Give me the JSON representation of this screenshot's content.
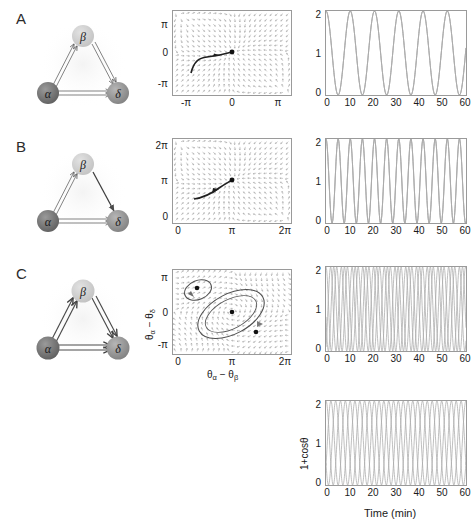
{
  "figure": {
    "panels": [
      {
        "letter": "A",
        "network": {
          "nodes": [
            {
              "id": "alpha",
              "label": "α",
              "shade": "dark"
            },
            {
              "id": "beta",
              "label": "β",
              "shade": "light"
            },
            {
              "id": "delta",
              "label": "δ",
              "shade": "medium"
            }
          ],
          "edges": [
            {
              "from": "alpha",
              "to": "beta",
              "style": "open-double"
            },
            {
              "from": "beta",
              "to": "delta",
              "style": "open-double"
            },
            {
              "from": "alpha",
              "to": "delta",
              "style": "open-double"
            }
          ]
        },
        "phase_plot": {
          "x_ticks": [
            "-π",
            "0",
            "π"
          ],
          "y_ticks": [
            "π",
            "0",
            "-π"
          ],
          "xlim": [
            -3.14159,
            3.14159
          ],
          "ylim": [
            -3.14159,
            3.14159
          ],
          "fixed_points": [
            {
              "x": 0,
              "y": 0
            }
          ],
          "trajectory_end": {
            "x": 0,
            "y": 0
          }
        },
        "time_plot": {
          "x_ticks": [
            "0",
            "10",
            "20",
            "30",
            "40",
            "50",
            "60"
          ],
          "y_ticks": [
            "0",
            "1",
            "2"
          ],
          "xlim": [
            0,
            60
          ],
          "ylim": [
            0,
            2
          ],
          "period_min": 10.4,
          "n_traces": 3,
          "phase_offsets_frac": [
            0.0,
            0.0,
            0.0
          ]
        }
      },
      {
        "letter": "B",
        "network": {
          "nodes": [
            {
              "id": "alpha",
              "label": "α",
              "shade": "dark"
            },
            {
              "id": "beta",
              "label": "β",
              "shade": "light"
            },
            {
              "id": "delta",
              "label": "δ",
              "shade": "medium"
            }
          ],
          "edges": [
            {
              "from": "alpha",
              "to": "beta",
              "style": "open-double"
            },
            {
              "from": "beta",
              "to": "delta",
              "style": "solid"
            },
            {
              "from": "alpha",
              "to": "delta",
              "style": "open-double"
            }
          ]
        },
        "phase_plot": {
          "x_ticks": [
            "0",
            "π",
            "2π"
          ],
          "y_ticks": [
            "2π",
            "π",
            "0"
          ],
          "xlim": [
            0,
            6.28318
          ],
          "ylim": [
            0,
            6.28318
          ],
          "fixed_points": [
            {
              "x": 3.14159,
              "y": 3.14159
            }
          ],
          "trajectory_end": {
            "x": 3.14159,
            "y": 3.14159
          }
        },
        "time_plot": {
          "x_ticks": [
            "0",
            "10",
            "20",
            "30",
            "40",
            "50",
            "60"
          ],
          "y_ticks": [
            "0",
            "1",
            "2"
          ],
          "xlim": [
            0,
            60
          ],
          "ylim": [
            0,
            2
          ],
          "period_min": 5.2,
          "n_traces": 3,
          "phase_offsets_frac": [
            0.0,
            0.0,
            0.0
          ]
        }
      },
      {
        "letter": "C",
        "network": {
          "nodes": [
            {
              "id": "alpha",
              "label": "α",
              "shade": "dark"
            },
            {
              "id": "beta",
              "label": "β",
              "shade": "light"
            },
            {
              "id": "delta",
              "label": "δ",
              "shade": "medium"
            }
          ],
          "edges": [
            {
              "from": "alpha",
              "to": "beta",
              "style": "open-double-bold"
            },
            {
              "from": "beta",
              "to": "delta",
              "style": "open-double-bold"
            },
            {
              "from": "alpha",
              "to": "delta",
              "style": "open-double-bold"
            }
          ]
        },
        "phase_plot": {
          "x_ticks": [
            "0",
            "π",
            "2π"
          ],
          "y_ticks": [
            "π",
            "0",
            "-π"
          ],
          "xlim": [
            0,
            6.28318
          ],
          "ylim": [
            -3.14159,
            3.14159
          ],
          "xlabel": "θα − θβ",
          "ylabel": "θα − θδ",
          "xlabel_parts": {
            "t1": "θ",
            "s1": "α",
            "dash": " − ",
            "t2": "θ",
            "s2": "β"
          },
          "ylabel_parts": {
            "t1": "θ",
            "s1": "α",
            "dash": " − ",
            "t2": "θ",
            "s2": "δ"
          },
          "fixed_points": [
            {
              "x": 1.15,
              "y": 1.95
            },
            {
              "x": 3.14159,
              "y": 0.0
            },
            {
              "x": 4.45,
              "y": -1.55
            }
          ],
          "closed_orbits": 2
        },
        "time_plot": {
          "x_ticks": [
            "0",
            "10",
            "20",
            "30",
            "40",
            "50",
            "60"
          ],
          "y_ticks": [
            "0",
            "1",
            "2"
          ],
          "xlim": [
            0,
            60
          ],
          "ylim": [
            0,
            2
          ],
          "period_min": 4.6,
          "n_traces": 3,
          "phase_offsets_frac": [
            0.0,
            0.28,
            0.57
          ]
        }
      }
    ],
    "bottom_plot": {
      "x_ticks": [
        "0",
        "10",
        "20",
        "30",
        "40",
        "50",
        "60"
      ],
      "y_ticks": [
        "0",
        "1",
        "2"
      ],
      "xlim": [
        0,
        60
      ],
      "ylim": [
        0,
        2
      ],
      "xlabel": "Time (min)",
      "ylabel": "1+cosθ",
      "period_min": 6.2,
      "n_traces": 3,
      "phase_offsets_frac": [
        0.0,
        0.33,
        0.66
      ]
    },
    "colors": {
      "node_dark": "#6d6d6d",
      "node_light": "#c9c9c9",
      "node_medium": "#8f8f8f",
      "axis": "#9a9a9a",
      "trace": "#a9a9a9",
      "vector": "#9e9e9e",
      "trajectory": "#2f2f2f"
    }
  }
}
